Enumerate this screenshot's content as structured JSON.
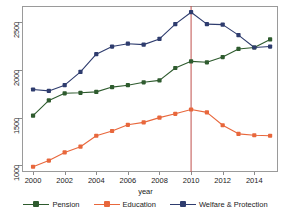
{
  "top_caption": "",
  "axes": {
    "x_title": "year",
    "y_title": "",
    "x_ticks": [
      2000,
      2002,
      2004,
      2006,
      2008,
      2010,
      2012,
      2014
    ],
    "y_ticks": [
      1000,
      1500,
      2000,
      2500
    ],
    "xlim": [
      1999.3,
      2015.5
    ],
    "ylim": [
      940,
      2680
    ],
    "grid": false
  },
  "annotations": {
    "vline_year": 2010,
    "vline_color": "#c0504d"
  },
  "legend": {
    "position": "bottom",
    "items": [
      {
        "label": "Pension",
        "color": "#2e5b2e",
        "marker": "square"
      },
      {
        "label": "Education",
        "color": "#e8673c",
        "marker": "square"
      },
      {
        "label": "Welfare & Protection",
        "color": "#2e3c6e",
        "marker": "square"
      }
    ]
  },
  "chart_data": {
    "type": "line",
    "title": "",
    "xlabel": "year",
    "ylabel": "",
    "xlim": [
      1999.3,
      2015.5
    ],
    "ylim": [
      940,
      2680
    ],
    "grid": false,
    "legend_position": "bottom",
    "x": [
      2000,
      2001,
      2002,
      2003,
      2004,
      2005,
      2006,
      2007,
      2008,
      2009,
      2010,
      2011,
      2012,
      2013,
      2014,
      2015
    ],
    "series": [
      {
        "name": "Pension",
        "color": "#2e5b2e",
        "values": [
          1530,
          1690,
          1765,
          1770,
          1780,
          1830,
          1850,
          1880,
          1900,
          2030,
          2100,
          2090,
          2145,
          2230,
          2245,
          2330
        ]
      },
      {
        "name": "Education",
        "color": "#e8673c",
        "values": [
          995,
          1060,
          1145,
          1205,
          1320,
          1370,
          1435,
          1460,
          1510,
          1550,
          1595,
          1565,
          1430,
          1340,
          1325,
          1320
        ]
      },
      {
        "name": "Welfare & Protection",
        "color": "#2e3c6e",
        "values": [
          1805,
          1790,
          1850,
          1990,
          2175,
          2255,
          2285,
          2275,
          2335,
          2490,
          2615,
          2490,
          2485,
          2375,
          2245,
          2255
        ]
      }
    ],
    "annotations": [
      {
        "type": "vline",
        "x": 2010,
        "color": "#c0504d"
      }
    ]
  }
}
